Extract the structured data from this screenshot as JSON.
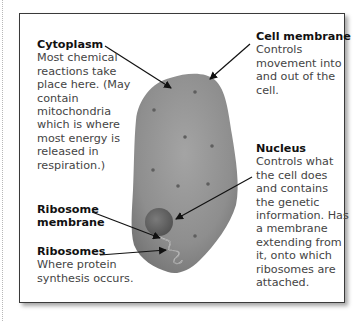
{
  "diagram": {
    "colors": {
      "frame_border": "#3a3a3a",
      "cell_fill": "#8c8c8c",
      "cell_highlight": "#a2a2a2",
      "nucleus_fill": "#6e6e6e",
      "dots": "#5e5e5e",
      "arrows": "#111111",
      "title_text": "#111111",
      "body_text": "#444444"
    },
    "labels": {
      "cytoplasm": {
        "title": "Cytoplasm",
        "description": "Most chemical\nreactions take\nplace here. (May\ncontain\nmitochondria\nwhich is where\nmost energy is\nreleased in\nrespiration.)"
      },
      "cell_membrane": {
        "title": "Cell membrane",
        "description": "Controls\nmovement into\nand out of the\ncell."
      },
      "nucleus": {
        "title": "Nucleus",
        "description": "Controls what\nthe cell does\nand contains\nthe genetic\ninformation. Has\na membrane\nextending from\nit, onto which\nribosomes are\nattached."
      },
      "ribosome_membrane": {
        "title": "Ribosome\nmembrane"
      },
      "ribosomes": {
        "title": "Ribosomes",
        "description": "Where protein\nsynthesis occurs."
      }
    }
  }
}
